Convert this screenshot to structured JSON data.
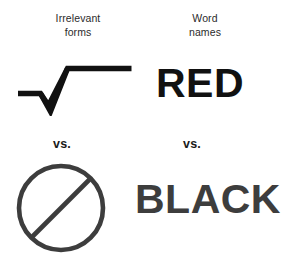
{
  "figure": {
    "background_color": "#ffffff",
    "width": 281,
    "height": 269
  },
  "columns": {
    "left": {
      "heading": "Irrelevant\nforms",
      "heading_line1": "Irrelevant",
      "heading_line2": "forms"
    },
    "right": {
      "heading": "Word\nnames",
      "heading_line1": "Word",
      "heading_line2": "names"
    }
  },
  "separators": {
    "left_label": "vs.",
    "right_label": "vs."
  },
  "stimuli": [
    {
      "id": "radical",
      "column": "left",
      "row": "top",
      "kind": "symbol",
      "icon": "radical-sign-icon",
      "label": "√",
      "color": "#111111"
    },
    {
      "id": "red",
      "column": "right",
      "row": "top",
      "kind": "word",
      "label": "RED",
      "color": "#111111"
    },
    {
      "id": "no-sign",
      "column": "left",
      "row": "bottom",
      "kind": "symbol",
      "icon": "prohibition-sign-icon",
      "label": "⊘",
      "color": "#3d3d3d"
    },
    {
      "id": "black",
      "column": "right",
      "row": "bottom",
      "kind": "word",
      "label": "BLACK",
      "color": "#3d3d3d"
    }
  ],
  "colors": {
    "ink_black": "#111111",
    "ink_gray": "#3d3d3d",
    "heading_gray": "#2b2b2b",
    "background": "#ffffff"
  }
}
